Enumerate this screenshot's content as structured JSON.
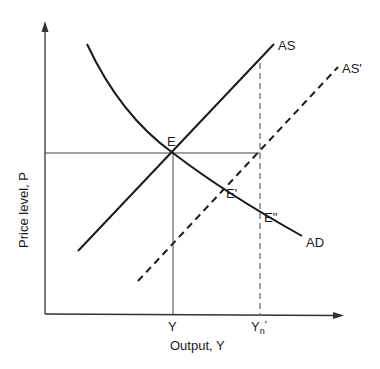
{
  "diagram": {
    "type": "economics-ad-as",
    "axes": {
      "x_label": "Output, Y",
      "y_label": "Price level, P"
    },
    "curves": {
      "ad": {
        "label": "AD",
        "style": "solid"
      },
      "as": {
        "label": "AS",
        "style": "solid"
      },
      "as_prime": {
        "label": "AS'",
        "style": "dashed"
      }
    },
    "points": {
      "e": "E",
      "e_prime": "E'",
      "e_double_prime": "E\""
    },
    "x_ticks": {
      "y": "Y",
      "yn_prime_base": "Y",
      "yn_prime_sub": "n",
      "yn_prime_mark": "'"
    },
    "colors": {
      "line": "#1a1a1a",
      "guide": "#444444"
    }
  }
}
